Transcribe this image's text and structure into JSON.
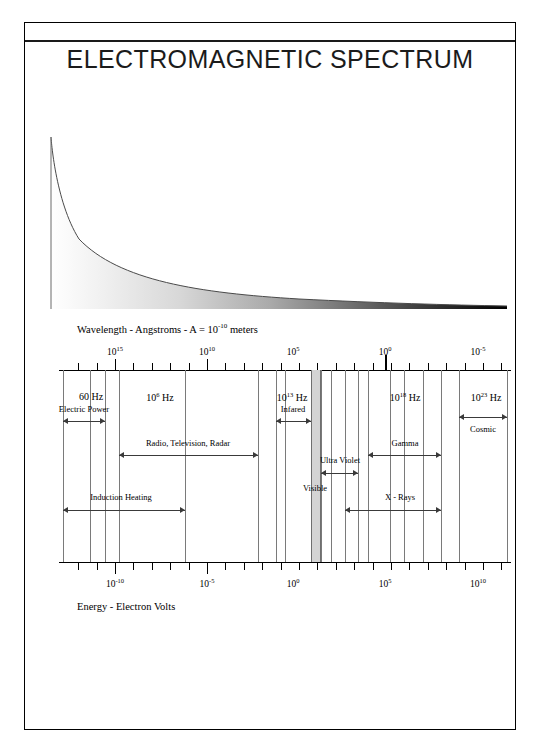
{
  "document": {
    "title": "ELECTROMAGNETIC SPECTRUM",
    "wavelength_caption_parts": {
      "prefix": "Wavelength - Angstroms - A = 10",
      "exponent": "-10",
      "suffix": " meters"
    },
    "energy_caption": "Energy - Electron Volts"
  },
  "chart_data": {
    "type": "bar",
    "title": "ELECTROMAGNETIC SPECTRUM",
    "subtitle": "",
    "xlabel": "Wavelength - Angstroms",
    "ylabel": "Energy - Electron Volts",
    "grid": false,
    "legend_position": "none",
    "top_axis": {
      "name": "Wavelength - Angstroms",
      "tick_labels": [
        "10",
        "10",
        "10",
        "10",
        "10"
      ],
      "tick_exponents": [
        "15",
        "10",
        "5",
        "0",
        "-5"
      ],
      "tick_positions_px": [
        115,
        207,
        293,
        385,
        478
      ],
      "decades_per_label": 5
    },
    "bottom_axis": {
      "name": "Energy - Electron Volts",
      "tick_labels": [
        "10",
        "10",
        "10",
        "10",
        "10"
      ],
      "tick_exponents": [
        "-10",
        "-5",
        "0",
        "5",
        "10"
      ],
      "tick_positions_px": [
        115,
        207,
        293,
        385,
        478
      ]
    },
    "frequency_markers": [
      {
        "label": "60 Hz",
        "exponent": "",
        "x": 91
      },
      {
        "label": "10 Hz",
        "exponent": "6",
        "x": 160
      },
      {
        "label": "10 Hz",
        "exponent": "13",
        "x": 292
      },
      {
        "label": "10 Hz",
        "exponent": "18",
        "x": 405
      },
      {
        "label": "10 Hz",
        "exponent": "23",
        "x": 486
      }
    ],
    "bands": [
      {
        "name": "Electric Power",
        "x1": 63,
        "x2": 105,
        "label_x": 84,
        "label_y": 404,
        "arrow_y": 418
      },
      {
        "name": "Radio, Television, Radar",
        "x1": 119,
        "x2": 258,
        "label_x": 188,
        "label_y": 438,
        "arrow_y": 452
      },
      {
        "name": "Infared",
        "x1": 276,
        "x2": 311,
        "label_x": 293,
        "label_y": 404,
        "arrow_y": 418
      },
      {
        "name": "Ultra Violet",
        "x1": 321,
        "x2": 358,
        "label_x": 340,
        "label_y": 455,
        "arrow_y": 470
      },
      {
        "name": "Visible",
        "x1": 311,
        "x2": 321,
        "label_x": 315,
        "label_y": 483,
        "arrow_y": 497
      },
      {
        "name": "Gamma",
        "x1": 368,
        "x2": 441,
        "label_x": 405,
        "label_y": 438,
        "arrow_y": 452
      },
      {
        "name": "X - Rays",
        "x1": 345,
        "x2": 441,
        "label_x": 400,
        "label_y": 492,
        "arrow_y": 507
      },
      {
        "name": "Cosmic",
        "x1": 459,
        "x2": 507,
        "label_x": 483,
        "label_y": 424,
        "arrow_y": 414
      },
      {
        "name": "Induction Heating",
        "x1": 63,
        "x2": 185,
        "label_x": 121,
        "label_y": 492,
        "arrow_y": 507
      }
    ],
    "gridlines_px": [
      63,
      90,
      105,
      119,
      185,
      258,
      276,
      285,
      311,
      321,
      331,
      345,
      358,
      368,
      390,
      404,
      423,
      441,
      459,
      507
    ],
    "visible_band": {
      "x": 311,
      "width": 10,
      "fill": "#d4d4d4"
    },
    "wedge": {
      "description": "decaying-exponential wedge filled with white-to-black horizontal gradient",
      "gradient_from": "#ffffff",
      "gradient_to": "#000000"
    }
  },
  "colors": {
    "ink": "#000000",
    "rule": "#1a1a1a",
    "gridline": "#7a7a7a",
    "arrow": "#3a3a3a",
    "visible_fill": "#d4d4d4"
  }
}
